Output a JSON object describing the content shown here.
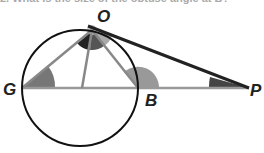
{
  "question": {
    "text": "2. What is the size of the obtuse angle at B?"
  },
  "diagram": {
    "points": {
      "O": "O",
      "G": "G",
      "B": "B",
      "P": "P"
    },
    "colors": {
      "circle": "#111111",
      "segment": "#888888",
      "tangent": "#222222",
      "angle_dark": "#333333",
      "angle_mid": "#777777",
      "angle_light": "#aaaaaa"
    }
  }
}
